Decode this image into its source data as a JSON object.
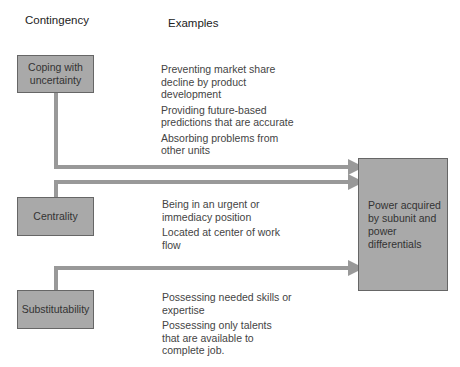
{
  "headers": {
    "contingency": "Contingency",
    "examples": "Examples"
  },
  "contingencies": [
    {
      "label": "Coping with uncertainty",
      "examples": [
        "Preventing market share decline by product development",
        "Providing future-based predictions that are accurate",
        "Absorbing problems from other units"
      ]
    },
    {
      "label": "Centrality",
      "examples": [
        "Being in an urgent or immediacy position",
        "Located at center of work flow"
      ]
    },
    {
      "label": "Substitutability",
      "examples": [
        "Possessing needed skills or expertise",
        "Possessing only talents that are available to complete job."
      ]
    }
  ],
  "outcome": {
    "label": "Power acquired by subunit and power differentials"
  },
  "colors": {
    "box_fill": "#a9a9a9",
    "arrow": "#999999"
  }
}
